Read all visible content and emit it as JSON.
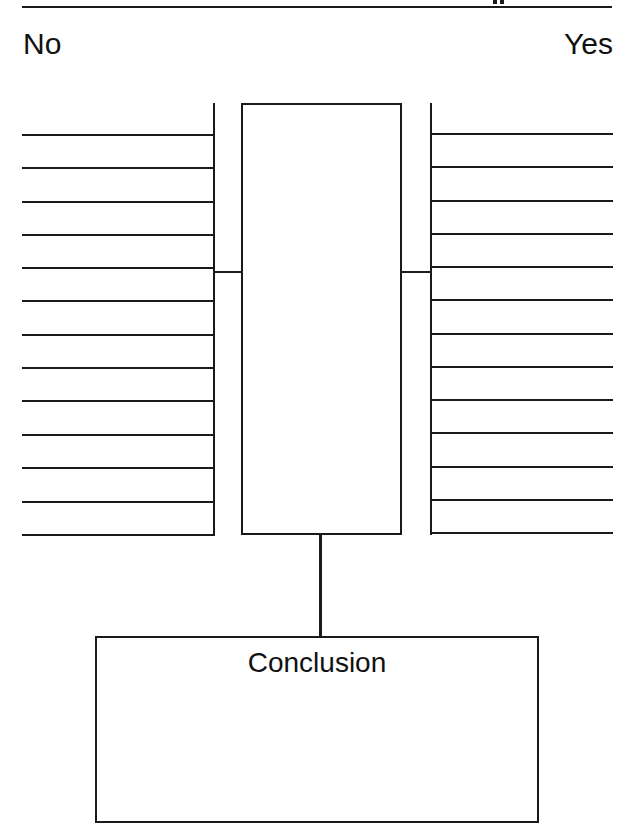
{
  "header": {
    "left_label": "No",
    "right_label": "Yes"
  },
  "organizer": {
    "type": "yes-no decision chart",
    "left_column": {
      "label": "No",
      "line_count": 13
    },
    "center_box": {
      "label": ""
    },
    "right_column": {
      "label": "Yes",
      "line_count": 13
    }
  },
  "conclusion": {
    "title": "Conclusion"
  },
  "colors": {
    "ink": "#1a1a1a",
    "background": "#ffffff"
  }
}
